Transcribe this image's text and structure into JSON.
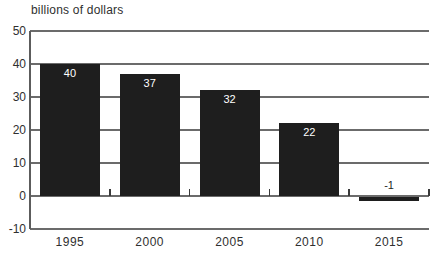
{
  "figure": {
    "caption": "billions of dollars"
  },
  "chart_data": {
    "type": "bar",
    "title": "",
    "ylabel": "billions of dollars",
    "xlabel": "",
    "categories": [
      "1995",
      "2000",
      "2005",
      "2010",
      "2015"
    ],
    "values": [
      40,
      37,
      32,
      22,
      -1
    ],
    "bar_labels": [
      "40",
      "37",
      "32",
      "22",
      "-1"
    ],
    "ylim": [
      -10,
      50
    ],
    "yticks": [
      50,
      40,
      30,
      20,
      10,
      0,
      -10
    ],
    "ytick_interval": 10,
    "grid": true,
    "legend": false,
    "colors": {
      "bar": "#1e1e1e",
      "grid": "#6b6b6b",
      "axis": "#5c5c5c",
      "category_tick": "#3a3a3a",
      "text": "#2f2f2f",
      "bar_label_positive": "#ffffff",
      "bar_label_negative": "#1e1e1e",
      "background": "#ffffff"
    }
  }
}
